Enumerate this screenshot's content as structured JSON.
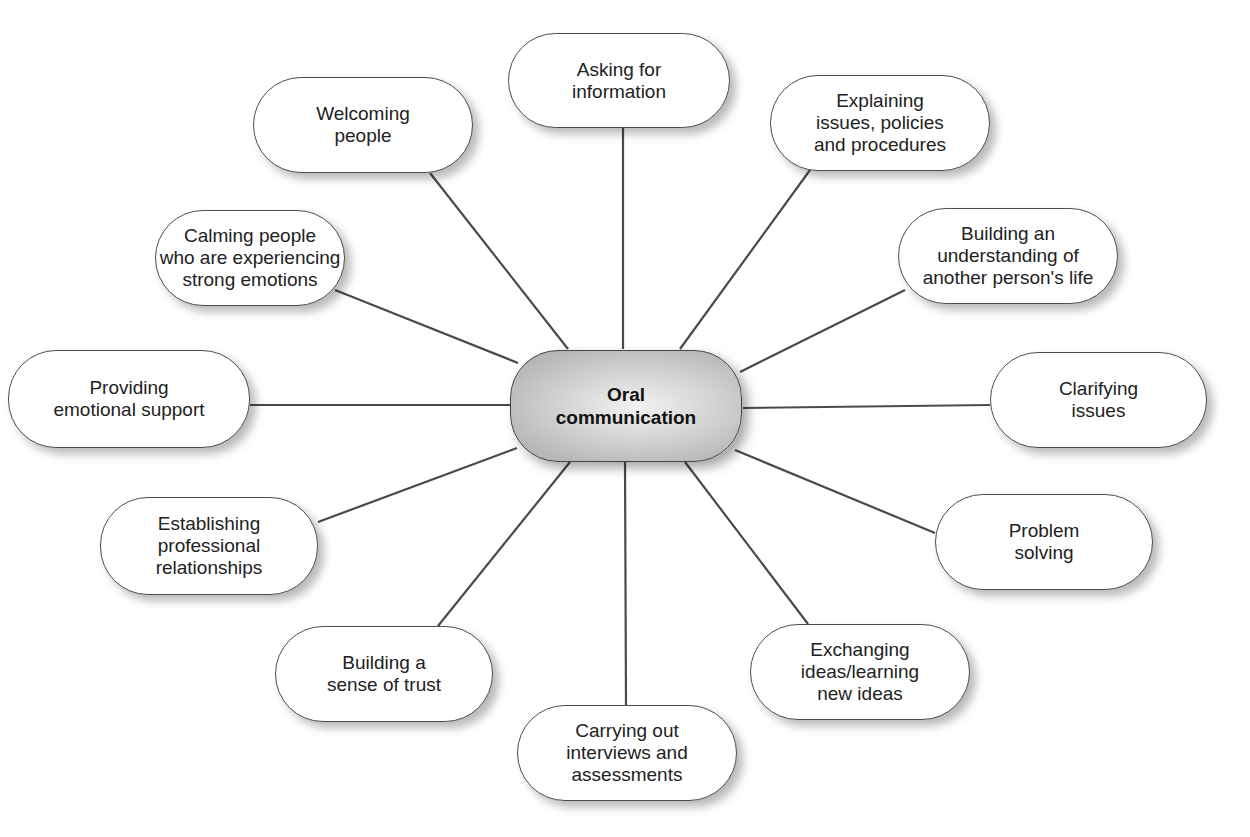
{
  "diagram": {
    "type": "mind-map",
    "central": {
      "label": "Oral\ncommunication",
      "fill": "#bdbdbd"
    },
    "nodes": [
      {
        "id": "asking",
        "label": "Asking for\ninformation",
        "x": 508,
        "y": 33,
        "w": 222,
        "h": 95,
        "anchor": [
          623,
          128
        ],
        "hub": [
          623,
          349
        ]
      },
      {
        "id": "explaining",
        "label": "Explaining\nissues, policies\nand procedures",
        "x": 770,
        "y": 75,
        "w": 220,
        "h": 96,
        "anchor": [
          810,
          170
        ],
        "hub": [
          680,
          349
        ]
      },
      {
        "id": "understanding",
        "label": "Building an\nunderstanding of\nanother person's life",
        "x": 898,
        "y": 208,
        "w": 220,
        "h": 96,
        "anchor": [
          905,
          290
        ],
        "hub": [
          740,
          372
        ]
      },
      {
        "id": "clarifying",
        "label": "Clarifying\nissues",
        "x": 990,
        "y": 352,
        "w": 217,
        "h": 96,
        "anchor": [
          990,
          405
        ],
        "hub": [
          743,
          408
        ]
      },
      {
        "id": "problem",
        "label": "Problem\nsolving",
        "x": 935,
        "y": 494,
        "w": 218,
        "h": 96,
        "anchor": [
          935,
          533
        ],
        "hub": [
          735,
          450
        ]
      },
      {
        "id": "exchanging",
        "label": "Exchanging\nideas/learning\nnew ideas",
        "x": 750,
        "y": 624,
        "w": 220,
        "h": 96,
        "anchor": [
          808,
          624
        ],
        "hub": [
          685,
          462
        ]
      },
      {
        "id": "carrying",
        "label": "Carrying out\ninterviews and\nassessments",
        "x": 517,
        "y": 705,
        "w": 220,
        "h": 96,
        "anchor": [
          626,
          705
        ],
        "hub": [
          625,
          462
        ]
      },
      {
        "id": "trust",
        "label": "Building a\nsense of trust",
        "x": 275,
        "y": 626,
        "w": 218,
        "h": 96,
        "anchor": [
          438,
          626
        ],
        "hub": [
          570,
          462
        ]
      },
      {
        "id": "establishing",
        "label": "Establishing\nprofessional\nrelationships",
        "x": 100,
        "y": 497,
        "w": 218,
        "h": 98,
        "anchor": [
          318,
          522
        ],
        "hub": [
          517,
          448
        ]
      },
      {
        "id": "providing",
        "label": "Providing\nemotional support",
        "x": 8,
        "y": 350,
        "w": 242,
        "h": 98,
        "anchor": [
          250,
          405
        ],
        "hub": [
          510,
          405
        ]
      },
      {
        "id": "calming",
        "label": "Calming people\nwho are experiencing\nstrong emotions",
        "x": 155,
        "y": 210,
        "w": 190,
        "h": 96,
        "anchor": [
          335,
          290
        ],
        "hub": [
          518,
          363
        ]
      },
      {
        "id": "welcoming",
        "label": "Welcoming\npeople",
        "x": 253,
        "y": 77,
        "w": 220,
        "h": 96,
        "anchor": [
          430,
          173
        ],
        "hub": [
          568,
          349
        ]
      }
    ],
    "line_color": "#4a4a4a"
  }
}
